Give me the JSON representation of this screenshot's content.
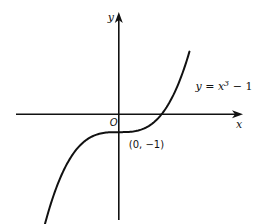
{
  "chart_data": {
    "type": "line",
    "title": "",
    "xlabel": "x",
    "ylabel": "y",
    "origin_label": "O",
    "xlim": [
      -2.4,
      2.9
    ],
    "ylim": [
      -5.9,
      5.7
    ],
    "grid": false,
    "legend": "none",
    "series": [
      {
        "name": "y = x³ − 1",
        "function": "x^3 - 1",
        "x_range": [
          -2.12,
          1.65
        ]
      }
    ],
    "annotations": [
      {
        "text": "(0, −1)",
        "x": 0,
        "y": -1,
        "kind": "point-label"
      },
      {
        "text_prefix": "y = x",
        "superscript": "3",
        "text_suffix": " − 1",
        "kind": "curve-label"
      }
    ]
  }
}
